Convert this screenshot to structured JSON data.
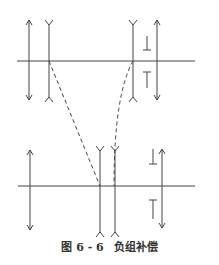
{
  "caption": {
    "figure_number": "图 6 - 6",
    "title": "负组补偿"
  },
  "colors": {
    "line": "#444444",
    "background": "#ffffff"
  },
  "diagram": {
    "top_configuration": {
      "axis_y": 61,
      "elements": [
        {
          "type": "converging-lens",
          "x": 29
        },
        {
          "type": "diverging-lens",
          "x": 49
        },
        {
          "type": "diverging-lens",
          "x": 133
        },
        {
          "type": "converging-lens",
          "x": 157
        }
      ],
      "image_marks_x": 147
    },
    "bottom_configuration": {
      "axis_y": 186,
      "elements": [
        {
          "type": "converging-lens",
          "x": 30
        },
        {
          "type": "diverging-lens",
          "x": 100
        },
        {
          "type": "diverging-lens",
          "x": 115
        },
        {
          "type": "converging-lens",
          "x": 162
        }
      ],
      "image_marks_x": 153
    },
    "motion_paths": [
      {
        "style": "dashed-straight",
        "from": "top diverging lens 1",
        "to": "bottom diverging lens 1"
      },
      {
        "style": "dashed-curved",
        "from": "top diverging lens 2",
        "to": "bottom diverging lens 2"
      }
    ]
  }
}
